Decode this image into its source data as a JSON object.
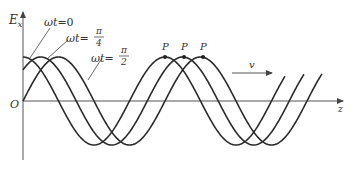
{
  "diagram": {
    "axes": {
      "y_label_main": "E",
      "y_label_sub": "x",
      "x_label": "z",
      "origin_label": "O"
    },
    "curves": [
      {
        "label_prefix": "ωt=",
        "label_value": "0",
        "phase_shift": 0
      },
      {
        "label_prefix": "ωt=",
        "label_num": "π",
        "label_den": "4",
        "phase_shift": 0.7854
      },
      {
        "label_prefix": "ωt=",
        "label_num": "π",
        "label_den": "2",
        "phase_shift": 1.5708
      }
    ],
    "points": [
      {
        "label": "P"
      },
      {
        "label": "P"
      },
      {
        "label": "P"
      }
    ],
    "velocity_label": "v",
    "colors": {
      "curve": "#2b2b2b",
      "axis": "#555555",
      "text": "#333333"
    }
  }
}
